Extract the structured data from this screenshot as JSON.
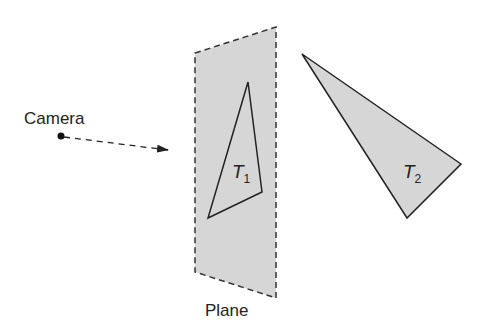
{
  "labels": {
    "camera": "Camera",
    "plane": "Plane",
    "t1_main": "T",
    "t1_sub": "1",
    "t2_main": "T",
    "t2_sub": "2"
  },
  "colors": {
    "fill": "#d6d6d6",
    "stroke": "#333333",
    "text": "#222222"
  }
}
